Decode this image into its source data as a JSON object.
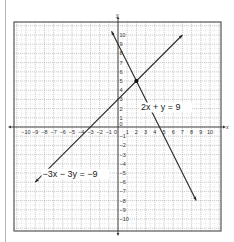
{
  "chart_data": {
    "type": "line",
    "title": "",
    "xlabel": "x",
    "ylabel": "y",
    "xlim": [
      -10,
      10
    ],
    "ylim": [
      -10,
      10
    ],
    "grid": true,
    "x_ticks": [
      -10,
      -9,
      -8,
      -7,
      -6,
      -5,
      -4,
      -3,
      -2,
      -1,
      0,
      1,
      2,
      3,
      4,
      5,
      6,
      7,
      8,
      9,
      10
    ],
    "y_ticks": [
      -10,
      -9,
      -8,
      -7,
      -6,
      -5,
      -4,
      -3,
      -2,
      -1,
      0,
      1,
      2,
      3,
      4,
      5,
      6,
      7,
      8,
      9,
      10
    ],
    "series": [
      {
        "name": "2x + y = 9",
        "label": "2x + y = 9",
        "points": [
          [
            -0.7,
            10.4
          ],
          [
            8.5,
            -8
          ]
        ],
        "label_pos": [
          2.5,
          1.8
        ]
      },
      {
        "name": "-3x - 3y = -9",
        "label": "−3x − 3y = −9",
        "points": [
          [
            -9,
            -6
          ],
          [
            7,
            10
          ]
        ],
        "label_pos": [
          -8.2,
          -5.4
        ]
      }
    ],
    "annotations": [
      {
        "type": "point",
        "x": 2,
        "y": 5,
        "note": "intersection"
      }
    ]
  },
  "labels": {
    "x_axis": "x",
    "y_axis": "y"
  },
  "colors": {
    "line": "#2a2a2a",
    "grid_major": "#9a9a9a",
    "grid_minor": "#c8c8c8",
    "frame": "#555555"
  }
}
